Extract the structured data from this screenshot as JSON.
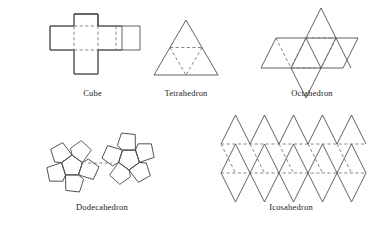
{
  "figure": {
    "background_color": "#ffffff",
    "edge_color": "#3a3a3a",
    "fold_color": "#6a6a6a",
    "solids": [
      {
        "id": "cube",
        "label": "Cube",
        "net_shape": "cross",
        "face_shape": "square",
        "face_count": 6
      },
      {
        "id": "tetrahedron",
        "label": "Tetrahedron",
        "net_shape": "large-triangle-with-inner-inverted-triangle",
        "face_shape": "triangle",
        "face_count": 4
      },
      {
        "id": "octahedron",
        "label": "Octahedron",
        "net_shape": "triangle-strip-with-two-flaps",
        "face_shape": "triangle",
        "face_count": 8
      },
      {
        "id": "dodecahedron",
        "label": "Dodecahedron",
        "net_shape": "two-pentagon-rosettes",
        "face_shape": "pentagon",
        "face_count": 12
      },
      {
        "id": "icosahedron",
        "label": "Icosahedron",
        "net_shape": "triangle-strip-band",
        "face_shape": "triangle",
        "face_count": 20
      }
    ]
  }
}
